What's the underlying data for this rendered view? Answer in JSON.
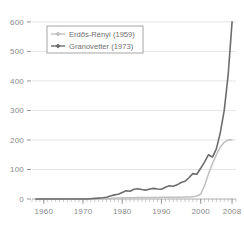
{
  "chart_data": {
    "type": "line",
    "title": "",
    "subtitle": "",
    "xlabel": "",
    "ylabel": "",
    "xlim": [
      1957,
      2009
    ],
    "ylim": [
      0,
      620
    ],
    "grid": true,
    "legend_position": "top-left",
    "y_ticks": [
      0,
      100,
      200,
      300,
      400,
      500,
      600
    ],
    "y_tick_labels": [
      "0",
      "100",
      "200",
      "300",
      "400",
      "500",
      "600"
    ],
    "x_ticks": [
      1960,
      1970,
      1980,
      1990,
      2000,
      2008
    ],
    "x_tick_labels": [
      "1960",
      "1970",
      "1980",
      "1990",
      "2000",
      "2008"
    ],
    "x_minor_tick_step": 1,
    "x": [
      1958,
      1959,
      1960,
      1961,
      1962,
      1963,
      1964,
      1965,
      1966,
      1967,
      1968,
      1969,
      1970,
      1971,
      1972,
      1973,
      1974,
      1975,
      1976,
      1977,
      1978,
      1979,
      1980,
      1981,
      1982,
      1983,
      1984,
      1985,
      1986,
      1987,
      1988,
      1989,
      1990,
      1991,
      1992,
      1993,
      1994,
      1995,
      1996,
      1997,
      1998,
      1999,
      2000,
      2001,
      2002,
      2003,
      2004,
      2005,
      2006,
      2007,
      2008
    ],
    "series": [
      {
        "name": "Erdős-Rényi (1959)",
        "color": "#c0c0c0",
        "marker": "diamond",
        "values": [
          0,
          0,
          0,
          0,
          0,
          0,
          0,
          0,
          0,
          0,
          0,
          0,
          0,
          1,
          1,
          1,
          1,
          2,
          2,
          2,
          3,
          3,
          4,
          4,
          4,
          4,
          5,
          5,
          5,
          5,
          5,
          5,
          6,
          6,
          6,
          6,
          6,
          6,
          7,
          7,
          8,
          10,
          16,
          46,
          86,
          120,
          150,
          176,
          192,
          200,
          201
        ]
      },
      {
        "name": "Granovetter (1973)",
        "color": "#6d6d6d",
        "marker": "diamond",
        "values": [
          0,
          0,
          0,
          0,
          0,
          0,
          0,
          0,
          0,
          0,
          0,
          0,
          0,
          0,
          1,
          2,
          3,
          4,
          6,
          10,
          14,
          16,
          22,
          28,
          26,
          33,
          35,
          32,
          30,
          34,
          36,
          34,
          33,
          40,
          45,
          43,
          48,
          56,
          60,
          72,
          86,
          84,
          104,
          126,
          150,
          142,
          170,
          225,
          300,
          420,
          600
        ]
      }
    ]
  },
  "legend": {
    "entries": [
      {
        "label": "Erdős-Rényi (1959)"
      },
      {
        "label": "Granovetter (1973)"
      }
    ]
  }
}
